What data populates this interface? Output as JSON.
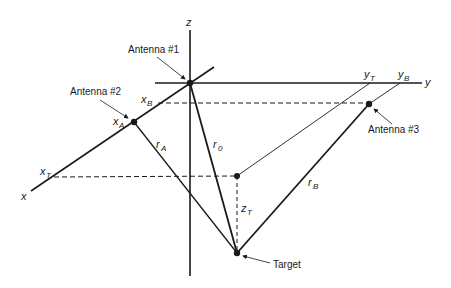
{
  "figure": {
    "type": "3D geometry diagram",
    "axes": {
      "x": "x",
      "y": "y",
      "z": "z"
    },
    "antennas": [
      {
        "label": "Antenna #1"
      },
      {
        "label": "Antenna #2"
      },
      {
        "label": "Antenna #3"
      }
    ],
    "target": {
      "label": "Target"
    },
    "coordinate_labels": {
      "x_A": {
        "base": "x",
        "sub": "A"
      },
      "x_B": {
        "base": "x",
        "sub": "B"
      },
      "x_T": {
        "base": "x",
        "sub": "T"
      },
      "y_T": {
        "base": "y",
        "sub": "T"
      },
      "y_B": {
        "base": "y",
        "sub": "B"
      },
      "z_T": {
        "base": "z",
        "sub": "T"
      }
    },
    "range_labels": {
      "r_0": {
        "base": "r",
        "sub": "0"
      },
      "r_A": {
        "base": "r",
        "sub": "A"
      },
      "r_B": {
        "base": "r",
        "sub": "B"
      }
    },
    "colors": {
      "line": "#1a1a1a",
      "background": "#ffffff"
    }
  }
}
